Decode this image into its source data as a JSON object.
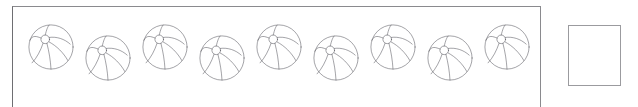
{
  "canvas": {
    "width": 638,
    "height": 107,
    "background_color": "#ffffff"
  },
  "items_panel": {
    "name": "beach-ball-row-panel",
    "border_color": "#6e6e72",
    "x": 12,
    "y": 6,
    "width": 529,
    "height": 104,
    "item_label": "beach ball",
    "item_count": 9,
    "items": [
      {
        "index": 1,
        "label": "beach ball",
        "x": 26,
        "y": 22,
        "size": 48,
        "row": "upper"
      },
      {
        "index": 2,
        "label": "beach ball",
        "x": 83,
        "y": 33,
        "size": 48,
        "row": "lower"
      },
      {
        "index": 3,
        "label": "beach ball",
        "x": 140,
        "y": 22,
        "size": 48,
        "row": "upper"
      },
      {
        "index": 4,
        "label": "beach ball",
        "x": 197,
        "y": 33,
        "size": 48,
        "row": "lower"
      },
      {
        "index": 5,
        "label": "beach ball",
        "x": 254,
        "y": 22,
        "size": 48,
        "row": "upper"
      },
      {
        "index": 6,
        "label": "beach ball",
        "x": 311,
        "y": 33,
        "size": 48,
        "row": "lower"
      },
      {
        "index": 7,
        "label": "beach ball",
        "x": 368,
        "y": 22,
        "size": 48,
        "row": "upper"
      },
      {
        "index": 8,
        "label": "beach ball",
        "x": 425,
        "y": 33,
        "size": 48,
        "row": "lower"
      },
      {
        "index": 9,
        "label": "beach ball",
        "x": 482,
        "y": 22,
        "size": 48,
        "row": "upper"
      }
    ],
    "icon_name": "beach-ball-icon",
    "icon_stroke_color": "#4a4a52",
    "icon_fill_color": "none"
  },
  "answer_box": {
    "name": "answer-input-box",
    "value": "",
    "placeholder": "",
    "border_color": "#9b9b9f",
    "fill_color": "#ffffff",
    "x": 568,
    "y": 25,
    "width": 53,
    "height": 61
  }
}
